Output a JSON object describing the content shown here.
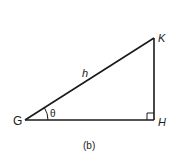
{
  "figure": {
    "caption": "(b)",
    "vertices": {
      "G": {
        "label": "G"
      },
      "H": {
        "label": "H"
      },
      "K": {
        "label": "K"
      }
    },
    "hypotenuse_label": "h",
    "angle_label": "θ",
    "right_angle_at": "H",
    "colors": {
      "stroke": "#1a1a1a",
      "background": "#ffffff"
    }
  }
}
